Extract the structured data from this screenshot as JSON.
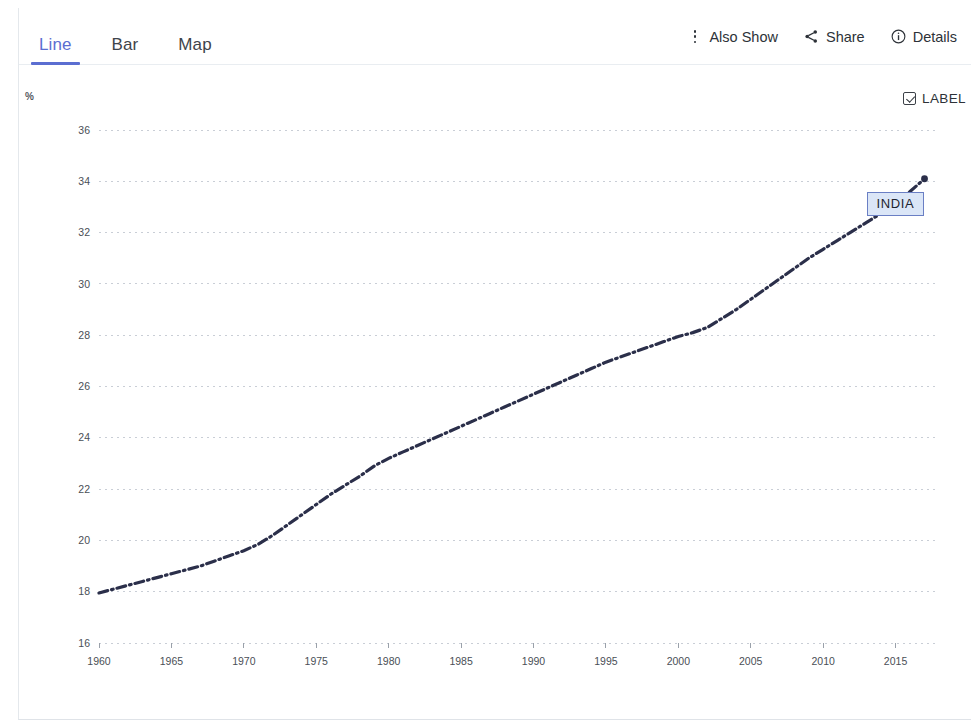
{
  "tabs": [
    {
      "label": "Line",
      "active": true
    },
    {
      "label": "Bar",
      "active": false
    },
    {
      "label": "Map",
      "active": false
    }
  ],
  "toolbar": {
    "also_show_label": "Also Show",
    "also_show_icon": "kebab-menu-icon",
    "share_label": "Share",
    "share_icon": "share-icon",
    "details_label": "Details",
    "details_icon": "info-circle-icon"
  },
  "chart_controls": {
    "label_toggle_text": "LABEL",
    "label_toggle_checked": true,
    "unit_label": "%"
  },
  "series_annotation": {
    "text": "INDIA",
    "fill": "#dbe6f7",
    "border": "#6a7fc4"
  },
  "colors": {
    "accent": "#5b6ed1",
    "line": "#2b2f4a",
    "grid": "#c9ced6",
    "tick_text": "#4a4f56"
  },
  "chart_data": {
    "type": "line",
    "title": "",
    "xlabel": "",
    "ylabel": "%",
    "xlim": [
      1960,
      2018
    ],
    "ylim": [
      16,
      36
    ],
    "ytick_values": [
      16,
      18,
      20,
      22,
      24,
      26,
      28,
      30,
      32,
      34,
      36
    ],
    "xtick_values": [
      1960,
      1965,
      1970,
      1975,
      1980,
      1985,
      1990,
      1995,
      2000,
      2005,
      2010,
      2015
    ],
    "grid": true,
    "legend_position": "inline-label",
    "series": [
      {
        "name": "INDIA",
        "color": "#2b2f4a",
        "style": "dash-dot",
        "x": [
          1960,
          1961,
          1962,
          1963,
          1964,
          1965,
          1966,
          1967,
          1968,
          1969,
          1970,
          1971,
          1972,
          1973,
          1974,
          1975,
          1976,
          1977,
          1978,
          1979,
          1980,
          1981,
          1982,
          1983,
          1984,
          1985,
          1986,
          1987,
          1988,
          1989,
          1990,
          1991,
          1992,
          1993,
          1994,
          1995,
          1996,
          1997,
          1998,
          1999,
          2000,
          2001,
          2002,
          2003,
          2004,
          2005,
          2006,
          2007,
          2008,
          2009,
          2010,
          2011,
          2012,
          2013,
          2014,
          2015,
          2016,
          2017
        ],
        "values": [
          17.95,
          18.1,
          18.25,
          18.4,
          18.55,
          18.7,
          18.85,
          19.0,
          19.2,
          19.4,
          19.6,
          19.85,
          20.2,
          20.6,
          21.0,
          21.4,
          21.8,
          22.15,
          22.5,
          22.9,
          23.2,
          23.45,
          23.7,
          23.95,
          24.2,
          24.45,
          24.7,
          24.95,
          25.2,
          25.45,
          25.7,
          25.95,
          26.2,
          26.45,
          26.7,
          26.95,
          27.15,
          27.35,
          27.55,
          27.75,
          27.95,
          28.1,
          28.3,
          28.65,
          29.0,
          29.4,
          29.8,
          30.2,
          30.6,
          31.0,
          31.35,
          31.7,
          32.05,
          32.4,
          32.75,
          33.1,
          33.6,
          34.1
        ]
      }
    ]
  }
}
